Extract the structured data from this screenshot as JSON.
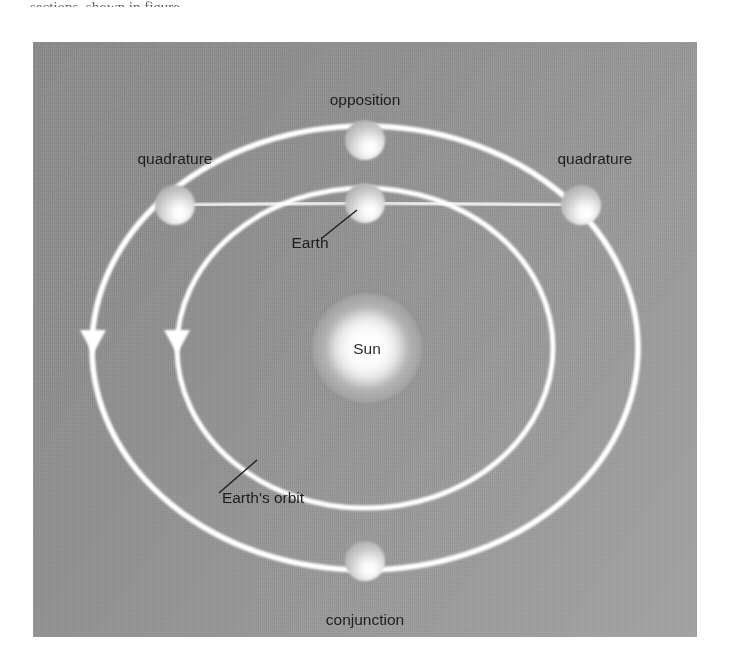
{
  "page": {
    "background_color": "#ffffff",
    "top_cut_text": "sections, shown in figure"
  },
  "figure": {
    "panel": {
      "background_color": "#949494",
      "x": 33,
      "y": 42,
      "width": 664,
      "height": 595
    },
    "line_color": "#ffffff",
    "leader_color": "#1d1d1d",
    "text_color": "#1d1d1d",
    "labels": {
      "opposition": "opposition",
      "quadrature_left": "quadrature",
      "quadrature_right": "quadrature",
      "earth": "Earth",
      "sun": "Sun",
      "earths_orbit": "Earth's orbit",
      "conjunction": "conjunction"
    },
    "bodies": [
      {
        "name": "sun",
        "label": "Sun",
        "cx": 334,
        "cy": 306,
        "r": 50,
        "kind": "star"
      },
      {
        "name": "earth",
        "label": "Earth",
        "cx": 332,
        "cy": 161,
        "r": 20,
        "kind": "planet"
      },
      {
        "name": "opposition-planet",
        "label": "opposition",
        "cx": 332,
        "cy": 98,
        "r": 20,
        "kind": "planet"
      },
      {
        "name": "quadrature-left-planet",
        "label": "quadrature",
        "cx": 142,
        "cy": 163,
        "r": 20,
        "kind": "planet"
      },
      {
        "name": "quadrature-right-planet",
        "label": "quadrature",
        "cx": 548,
        "cy": 163,
        "r": 20,
        "kind": "planet"
      },
      {
        "name": "conjunction-planet",
        "label": "conjunction",
        "cx": 332,
        "cy": 519,
        "r": 20,
        "kind": "planet"
      }
    ],
    "orbits": [
      {
        "name": "outer-orbit",
        "cx": 332,
        "cy": 306,
        "rx": 273,
        "ry": 222,
        "arrow_at": "left"
      },
      {
        "name": "inner-orbit-earth",
        "cx": 332,
        "cy": 306,
        "rx": 188,
        "ry": 160,
        "arrow_at": "left"
      }
    ],
    "sight_lines": [
      {
        "name": "sun-earth-axis",
        "from": "sun",
        "to": "opposition-planet"
      },
      {
        "name": "sun-conjunction-axis",
        "from": "sun",
        "to": "conjunction-planet"
      },
      {
        "name": "quadrature-left-sightline",
        "from": "earth",
        "to": "quadrature-left-planet"
      },
      {
        "name": "quadrature-right-sightline",
        "from": "earth",
        "to": "quadrature-right-planet"
      }
    ],
    "arrows": [
      {
        "name": "outer-orbit-direction-arrow",
        "x": 60,
        "y": 297
      },
      {
        "name": "inner-orbit-direction-arrow",
        "x": 144,
        "y": 297
      }
    ]
  }
}
